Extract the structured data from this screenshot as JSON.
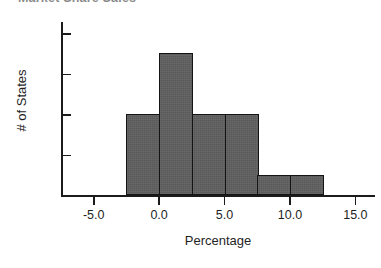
{
  "chart_data": {
    "type": "bar",
    "title": "Market Share Sales",
    "title_clipped": true,
    "xlabel": "Percentage",
    "ylabel": "# of States",
    "categories": [
      "-2.5 to 0.0",
      "0.0 to 2.5",
      "2.5 to 5.0",
      "5.0 to 7.5",
      "7.5 to 10.0",
      "10.0 to 12.5"
    ],
    "bin_edges": [
      -2.5,
      0.0,
      2.5,
      5.0,
      7.5,
      10.0,
      12.5
    ],
    "bin_width": 2.5,
    "values": [
      4,
      7,
      4,
      4,
      1,
      1
    ],
    "xlim": [
      -7.5,
      16.5
    ],
    "ylim": [
      0,
      8.6
    ],
    "xticks": [
      "-5.0",
      "0.0",
      "5.0",
      "10.0",
      "15.0"
    ],
    "xtick_values": [
      -5.0,
      0.0,
      5.0,
      10.0,
      15.0
    ],
    "yticks": [
      "2",
      "4",
      "6",
      "8"
    ],
    "ytick_values": [
      2,
      4,
      6,
      8
    ],
    "grid": false,
    "legend": null,
    "bar_fill_color": "#595959",
    "bar_edge_color": "#141414",
    "axis_color": "#1b1b1b",
    "background_color": "#ffffff"
  }
}
